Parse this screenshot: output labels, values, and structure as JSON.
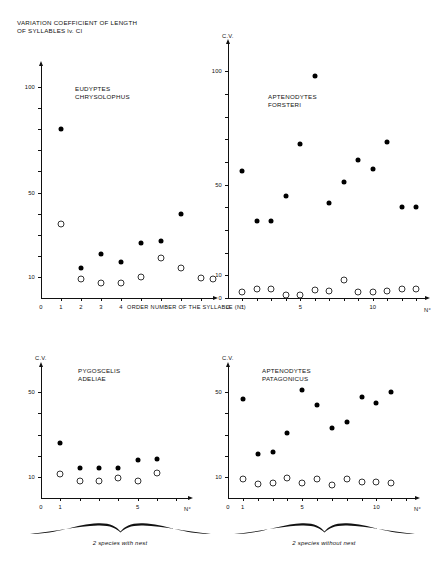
{
  "figure": {
    "title": "VARIATION COEFFICIENT OF LENGTH\nOF SYLLABLES lv. CI",
    "axis_y_name": "C.V.",
    "axis_x_name": "N°",
    "x_caption_panel1": "ORDER NUMBER  OF   THE  SYLLABLE (N°)",
    "brace_left_caption": "2 species with nest",
    "brace_right_caption": "2 species without nest"
  },
  "chart_data": [
    {
      "type": "scatter",
      "title": "EUDYPTES\nCHRYSOLOPHUS",
      "panel": "top-left",
      "xlabel": "ORDER NUMBER  OF   THE  SYLLABLE (N°)",
      "ylabel": "",
      "xlim": [
        0,
        8.6
      ],
      "ylim": [
        0,
        110
      ],
      "xticks": [
        0,
        1,
        2,
        3,
        4,
        5,
        6,
        7,
        8
      ],
      "xticklabels": [
        "0",
        "1",
        "2",
        "3",
        "4",
        "",
        "",
        "",
        ""
      ],
      "yticks": [
        10,
        20,
        30,
        40,
        50,
        60,
        70,
        80,
        90,
        100
      ],
      "yticklabels": [
        "10",
        "",
        "",
        "",
        "50",
        "",
        "",
        "",
        "",
        "100"
      ],
      "grid": false,
      "legend": "none",
      "series": [
        {
          "name": "filled",
          "marker": "filled-circle",
          "x": [
            1,
            2,
            3,
            4,
            5,
            6,
            7
          ],
          "values": [
            80,
            14,
            21,
            17,
            26,
            27,
            40
          ]
        },
        {
          "name": "open",
          "marker": "open-circle",
          "x": [
            1,
            2,
            3,
            4,
            5,
            6,
            7,
            8,
            8.6
          ],
          "values": [
            35,
            9,
            7,
            7,
            10,
            19,
            14,
            9.5,
            9.2
          ]
        }
      ]
    },
    {
      "type": "scatter",
      "title": "APTENODYTES\nFORSTERI",
      "panel": "top-right",
      "xlabel": "N°",
      "ylabel": "C.V.",
      "xlim": [
        0,
        13.6
      ],
      "ylim": [
        0,
        112
      ],
      "xticks": [
        0,
        1,
        2,
        3,
        4,
        5,
        6,
        7,
        8,
        9,
        10,
        11,
        12,
        13
      ],
      "xticklabels": [
        "0",
        "1",
        "",
        "",
        "",
        "5",
        "",
        "",
        "",
        "",
        "10",
        "",
        "",
        ""
      ],
      "yticks": [
        0,
        10,
        20,
        30,
        40,
        50,
        60,
        70,
        80,
        90,
        100
      ],
      "yticklabels": [
        "0",
        "10",
        "",
        "",
        "",
        "50",
        "",
        "",
        "",
        "",
        "100"
      ],
      "grid": false,
      "legend": "none",
      "series": [
        {
          "name": "filled",
          "marker": "filled-circle",
          "x": [
            1,
            2,
            3,
            4,
            5,
            6,
            7,
            8,
            9,
            10,
            11,
            12,
            13
          ],
          "values": [
            56,
            34,
            34,
            45,
            68,
            98,
            42,
            51,
            61,
            57,
            69,
            40,
            40
          ]
        },
        {
          "name": "open",
          "marker": "open-circle",
          "x": [
            1,
            2,
            3,
            4,
            5,
            6,
            7,
            8,
            9,
            10,
            11,
            12,
            13
          ],
          "values": [
            2.5,
            4,
            4,
            1.5,
            1.5,
            3.5,
            3,
            8,
            2.5,
            2.5,
            3,
            4,
            4
          ]
        }
      ]
    },
    {
      "type": "scatter",
      "title": "PYGOSCELIS\nADELIAE",
      "panel": "bottom-left",
      "xlabel": "N°",
      "ylabel": "C.V.",
      "xlim": [
        0,
        7.6
      ],
      "ylim": [
        0,
        62
      ],
      "xticks": [
        0,
        1,
        2,
        3,
        4,
        5,
        6,
        7
      ],
      "xticklabels": [
        "0",
        "1",
        "",
        "",
        "",
        "5",
        "",
        ""
      ],
      "yticks": [
        10,
        20,
        30,
        40,
        50
      ],
      "yticklabels": [
        "10",
        "",
        "",
        "",
        "50"
      ],
      "grid": false,
      "legend": "none",
      "series": [
        {
          "name": "filled",
          "marker": "filled-circle",
          "x": [
            1,
            2,
            3,
            4,
            5,
            6
          ],
          "values": [
            26,
            14,
            14,
            14,
            18,
            18.5
          ]
        },
        {
          "name": "open",
          "marker": "open-circle",
          "x": [
            1,
            2,
            3,
            4,
            5,
            6
          ],
          "values": [
            11.5,
            8,
            8,
            9.5,
            8,
            12
          ]
        }
      ]
    },
    {
      "type": "scatter",
      "title": "APTENODYTES\nPATAGONICUS",
      "panel": "bottom-right",
      "xlabel": "N°",
      "ylabel": "C.V.",
      "xlim": [
        0,
        12.6
      ],
      "ylim": [
        0,
        62
      ],
      "xticks": [
        0,
        1,
        2,
        3,
        4,
        5,
        6,
        7,
        8,
        9,
        10,
        11,
        12
      ],
      "xticklabels": [
        "0",
        "1",
        "",
        "",
        "",
        "5",
        "",
        "",
        "",
        "",
        "10",
        "",
        ""
      ],
      "yticks": [
        10,
        20,
        30,
        40,
        50
      ],
      "yticklabels": [
        "10",
        "",
        "",
        "",
        "50"
      ],
      "grid": false,
      "legend": "none",
      "series": [
        {
          "name": "filled",
          "marker": "filled-circle",
          "x": [
            1,
            2,
            3,
            4,
            5,
            6,
            7,
            8,
            9,
            10,
            11
          ],
          "values": [
            47,
            21,
            22,
            31,
            51,
            44,
            33,
            36,
            48,
            45,
            50
          ]
        },
        {
          "name": "open",
          "marker": "open-circle",
          "x": [
            1,
            2,
            3,
            4,
            5,
            6,
            7,
            8,
            9,
            10,
            11
          ],
          "values": [
            9,
            6.5,
            7,
            9.5,
            7,
            9,
            6,
            9,
            7.5,
            7.5,
            7
          ]
        }
      ]
    }
  ]
}
